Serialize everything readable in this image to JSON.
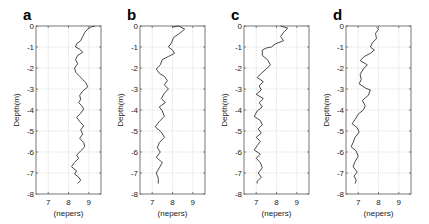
{
  "chart_data": [
    {
      "type": "line",
      "panel_label": "a",
      "xlabel": "(nepers)",
      "ylabel": "Depth(m)",
      "xlim": [
        6.4,
        9.6
      ],
      "ylim": [
        -8,
        0
      ],
      "xticks": [
        7,
        8,
        9
      ],
      "yticks": [
        0,
        -1,
        -2,
        -3,
        -4,
        -5,
        -6,
        -7,
        -8
      ],
      "grid": true,
      "orientation": "profile (x=value, y=depth)",
      "series": [
        {
          "name": "a",
          "points": [
            [
              9.3,
              0
            ],
            [
              9.1,
              -0.05
            ],
            [
              8.95,
              -0.15
            ],
            [
              8.8,
              -0.3
            ],
            [
              8.7,
              -0.5
            ],
            [
              8.6,
              -0.7
            ],
            [
              8.4,
              -0.85
            ],
            [
              8.35,
              -1.0
            ],
            [
              8.55,
              -1.1
            ],
            [
              8.7,
              -1.25
            ],
            [
              8.45,
              -1.4
            ],
            [
              8.35,
              -1.6
            ],
            [
              8.45,
              -1.8
            ],
            [
              8.3,
              -2.0
            ],
            [
              8.35,
              -2.2
            ],
            [
              8.55,
              -2.4
            ],
            [
              8.7,
              -2.55
            ],
            [
              8.85,
              -2.7
            ],
            [
              8.95,
              -2.9
            ],
            [
              8.7,
              -3.1
            ],
            [
              8.55,
              -3.3
            ],
            [
              8.6,
              -3.5
            ],
            [
              8.5,
              -3.65
            ],
            [
              8.65,
              -3.8
            ],
            [
              8.75,
              -3.95
            ],
            [
              8.6,
              -4.15
            ],
            [
              8.4,
              -4.35
            ],
            [
              8.55,
              -4.55
            ],
            [
              8.75,
              -4.75
            ],
            [
              8.6,
              -4.95
            ],
            [
              8.7,
              -5.15
            ],
            [
              8.55,
              -5.35
            ],
            [
              8.75,
              -5.55
            ],
            [
              8.8,
              -5.75
            ],
            [
              8.6,
              -5.95
            ],
            [
              8.4,
              -6.15
            ],
            [
              8.5,
              -6.3
            ],
            [
              8.3,
              -6.5
            ],
            [
              8.15,
              -6.7
            ],
            [
              8.4,
              -6.9
            ],
            [
              8.3,
              -7.05
            ],
            [
              8.5,
              -7.2
            ],
            [
              8.6,
              -7.35
            ],
            [
              8.45,
              -7.5
            ]
          ]
        }
      ]
    },
    {
      "type": "line",
      "panel_label": "b",
      "xlabel": "(nepers)",
      "ylabel": "Depth(m)",
      "xlim": [
        6.4,
        9.6
      ],
      "ylim": [
        -8,
        0
      ],
      "xticks": [
        7,
        8,
        9
      ],
      "yticks": [
        0,
        -1,
        -2,
        -3,
        -4,
        -5,
        -6,
        -7,
        -8
      ],
      "grid": true,
      "series": [
        {
          "name": "b",
          "points": [
            [
              8.0,
              -0.05
            ],
            [
              8.3,
              0
            ],
            [
              8.6,
              -0.15
            ],
            [
              8.35,
              -0.35
            ],
            [
              8.05,
              -0.55
            ],
            [
              7.95,
              -0.8
            ],
            [
              7.8,
              -1.0
            ],
            [
              8.0,
              -1.15
            ],
            [
              8.1,
              -1.3
            ],
            [
              7.8,
              -1.45
            ],
            [
              7.5,
              -1.6
            ],
            [
              7.4,
              -1.85
            ],
            [
              7.2,
              -2.05
            ],
            [
              7.35,
              -2.25
            ],
            [
              7.6,
              -2.4
            ],
            [
              7.75,
              -2.6
            ],
            [
              7.6,
              -2.8
            ],
            [
              7.8,
              -3.0
            ],
            [
              7.6,
              -3.2
            ],
            [
              7.45,
              -3.45
            ],
            [
              7.65,
              -3.65
            ],
            [
              7.35,
              -3.85
            ],
            [
              7.5,
              -4.05
            ],
            [
              7.6,
              -4.3
            ],
            [
              7.35,
              -4.55
            ],
            [
              7.15,
              -4.8
            ],
            [
              7.45,
              -5.05
            ],
            [
              7.6,
              -5.3
            ],
            [
              7.35,
              -5.55
            ],
            [
              7.25,
              -5.8
            ],
            [
              7.4,
              -6.0
            ],
            [
              7.2,
              -6.25
            ],
            [
              7.5,
              -6.5
            ],
            [
              7.35,
              -6.75
            ],
            [
              7.2,
              -7.0
            ],
            [
              7.3,
              -7.25
            ],
            [
              7.3,
              -7.5
            ]
          ]
        }
      ]
    },
    {
      "type": "line",
      "panel_label": "c",
      "xlabel": "(nepers)",
      "ylabel": "Depth(m)",
      "xlim": [
        6.4,
        9.6
      ],
      "ylim": [
        -8,
        0
      ],
      "xticks": [
        7,
        8,
        9
      ],
      "yticks": [
        0,
        -1,
        -2,
        -3,
        -4,
        -5,
        -6,
        -7,
        -8
      ],
      "grid": true,
      "series": [
        {
          "name": "c",
          "points": [
            [
              8.2,
              0
            ],
            [
              8.55,
              -0.1
            ],
            [
              8.35,
              -0.3
            ],
            [
              8.2,
              -0.5
            ],
            [
              8.35,
              -0.7
            ],
            [
              7.95,
              -0.85
            ],
            [
              7.75,
              -1.0
            ],
            [
              7.5,
              -1.05
            ],
            [
              7.3,
              -1.15
            ],
            [
              7.3,
              -1.4
            ],
            [
              7.55,
              -1.6
            ],
            [
              7.7,
              -1.85
            ],
            [
              7.5,
              -2.05
            ],
            [
              7.25,
              -2.25
            ],
            [
              7.05,
              -2.45
            ],
            [
              7.35,
              -2.65
            ],
            [
              7.15,
              -2.85
            ],
            [
              7.25,
              -3.05
            ],
            [
              7.0,
              -3.25
            ],
            [
              7.35,
              -3.45
            ],
            [
              7.15,
              -3.65
            ],
            [
              7.3,
              -3.85
            ],
            [
              7.05,
              -4.05
            ],
            [
              6.9,
              -4.3
            ],
            [
              7.2,
              -4.5
            ],
            [
              7.3,
              -4.7
            ],
            [
              7.1,
              -4.9
            ],
            [
              7.25,
              -5.1
            ],
            [
              7.0,
              -5.3
            ],
            [
              7.2,
              -5.5
            ],
            [
              7.05,
              -5.7
            ],
            [
              6.9,
              -5.9
            ],
            [
              7.2,
              -6.1
            ],
            [
              7.0,
              -6.3
            ],
            [
              7.2,
              -6.5
            ],
            [
              7.3,
              -6.75
            ],
            [
              7.1,
              -7.0
            ],
            [
              7.25,
              -7.2
            ],
            [
              7.05,
              -7.4
            ],
            [
              7.05,
              -7.5
            ]
          ]
        }
      ]
    },
    {
      "type": "line",
      "panel_label": "d",
      "xlabel": "(nepers)",
      "ylabel": "Depth(m)",
      "xlim": [
        6.4,
        9.6
      ],
      "ylim": [
        -8,
        0
      ],
      "xticks": [
        7,
        8,
        9
      ],
      "yticks": [
        0,
        -1,
        -2,
        -3,
        -4,
        -5,
        -6,
        -7,
        -8
      ],
      "grid": true,
      "series": [
        {
          "name": "d",
          "points": [
            [
              7.9,
              -0.05
            ],
            [
              8.0,
              -0.15
            ],
            [
              7.85,
              -0.35
            ],
            [
              7.9,
              -0.6
            ],
            [
              7.7,
              -0.8
            ],
            [
              7.6,
              -1.0
            ],
            [
              7.8,
              -1.15
            ],
            [
              7.6,
              -1.3
            ],
            [
              7.3,
              -1.45
            ],
            [
              7.1,
              -1.65
            ],
            [
              7.45,
              -1.85
            ],
            [
              7.25,
              -2.05
            ],
            [
              7.1,
              -2.3
            ],
            [
              7.15,
              -2.55
            ],
            [
              7.05,
              -2.75
            ],
            [
              7.35,
              -2.95
            ],
            [
              7.6,
              -3.05
            ],
            [
              7.5,
              -3.3
            ],
            [
              7.2,
              -3.55
            ],
            [
              7.35,
              -3.8
            ],
            [
              7.25,
              -4.0
            ],
            [
              7.0,
              -4.2
            ],
            [
              6.85,
              -4.45
            ],
            [
              6.7,
              -4.65
            ],
            [
              6.95,
              -4.85
            ],
            [
              7.05,
              -5.05
            ],
            [
              6.85,
              -5.3
            ],
            [
              6.75,
              -5.55
            ],
            [
              6.65,
              -5.75
            ],
            [
              6.9,
              -5.95
            ],
            [
              7.0,
              -6.2
            ],
            [
              6.85,
              -6.45
            ],
            [
              6.75,
              -6.7
            ],
            [
              6.95,
              -6.95
            ],
            [
              6.8,
              -7.15
            ],
            [
              6.9,
              -7.35
            ],
            [
              6.85,
              -7.5
            ]
          ]
        }
      ]
    }
  ],
  "panels": [
    {
      "label": "a",
      "axis_left": 36,
      "axis_top": 26,
      "axis_width": 65,
      "axis_height": 168
    },
    {
      "label": "b",
      "axis_left": 140,
      "axis_top": 26,
      "axis_width": 65,
      "axis_height": 168
    },
    {
      "label": "c",
      "axis_left": 244,
      "axis_top": 26,
      "axis_width": 65,
      "axis_height": 168
    },
    {
      "label": "d",
      "axis_left": 346,
      "axis_top": 26,
      "axis_width": 65,
      "axis_height": 168
    }
  ]
}
